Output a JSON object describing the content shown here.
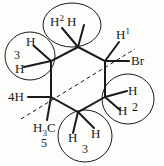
{
  "figure": {
    "kind": "chemical-structure-diagram",
    "background_color": "#fdfdfb",
    "line_color": "#1a1a1a",
    "text_color": "#1a1a1a"
  },
  "ring": {
    "name": "cyclohexane-ring",
    "vertices": [
      {
        "id": "v-top",
        "x": 78,
        "y": 47
      },
      {
        "id": "v-right-upper",
        "x": 105,
        "y": 61
      },
      {
        "id": "v-right-lower",
        "x": 105,
        "y": 97
      },
      {
        "id": "v-bottom",
        "x": 78,
        "y": 112
      },
      {
        "id": "v-left-lower",
        "x": 51,
        "y": 97
      },
      {
        "id": "v-left-upper",
        "x": 51,
        "y": 61
      }
    ]
  },
  "plane_line": {
    "name": "dashed-plane-line",
    "x1": 21,
    "y1": 119,
    "x2": 135,
    "y2": 49,
    "style": "dashed"
  },
  "bonds": [
    {
      "name": "bond-top-h-left",
      "x1": 78,
      "y1": 47,
      "x2": 62,
      "y2": 28
    },
    {
      "name": "bond-top-h-right",
      "x1": 78,
      "y1": 47,
      "x2": 84,
      "y2": 25
    },
    {
      "name": "bond-right-h1",
      "x1": 105,
      "y1": 61,
      "x2": 119,
      "y2": 42
    },
    {
      "name": "bond-right-br",
      "x1": 105,
      "y1": 61,
      "x2": 129,
      "y2": 61
    },
    {
      "name": "bond-rlow-h-upper",
      "x1": 105,
      "y1": 97,
      "x2": 127,
      "y2": 91
    },
    {
      "name": "bond-rlow-h-lower",
      "x1": 105,
      "y1": 97,
      "x2": 120,
      "y2": 110
    },
    {
      "name": "bond-bottom-h-left",
      "x1": 78,
      "y1": 112,
      "x2": 73,
      "y2": 133
    },
    {
      "name": "bond-bottom-h-right",
      "x1": 78,
      "y1": 112,
      "x2": 94,
      "y2": 128
    },
    {
      "name": "bond-llow-h4",
      "x1": 51,
      "y1": 97,
      "x2": 28,
      "y2": 97
    },
    {
      "name": "bond-llow-methyl",
      "x1": 51,
      "y1": 97,
      "x2": 47,
      "y2": 120
    },
    {
      "name": "bond-lup-h-upper",
      "x1": 51,
      "y1": 61,
      "x2": 34,
      "y2": 46
    },
    {
      "name": "bond-lup-h-lower",
      "x1": 51,
      "y1": 61,
      "x2": 24,
      "y2": 67
    }
  ],
  "circles": [
    {
      "name": "circle-h2-top",
      "cx": 72,
      "cy": 25,
      "rx": 29,
      "ry": 22
    },
    {
      "name": "circle-h3-left",
      "cx": 30,
      "cy": 56,
      "rx": 25,
      "ry": 24
    },
    {
      "name": "circle-h2-right",
      "cx": 128,
      "cy": 99,
      "rx": 26,
      "ry": 25
    },
    {
      "name": "circle-h3-bottom",
      "cx": 85,
      "cy": 136,
      "rx": 27,
      "ry": 26
    }
  ],
  "labels": {
    "top_pair": {
      "name": "label-h2-top",
      "h_left": "H",
      "superscript": "2",
      "h_right": "H"
    },
    "left_pair": {
      "name": "label-h3-left",
      "h_upper": "H",
      "number": "3",
      "h_lower": "H"
    },
    "h1": {
      "name": "label-h1",
      "symbol": "H",
      "superscript": "1"
    },
    "bromine": {
      "name": "label-bromine",
      "symbol": "Br"
    },
    "right_pair": {
      "name": "label-h2-right",
      "h_upper": "H",
      "h_lower": "H",
      "number": "2"
    },
    "bottom_pair": {
      "name": "label-h3-bottom",
      "h_left": "H",
      "h_right": "H",
      "number": "3"
    },
    "h4": {
      "name": "label-4h",
      "text": "4H"
    },
    "methyl": {
      "name": "label-methyl",
      "h": "H",
      "sub": "3",
      "c": "C",
      "number": "5"
    }
  }
}
